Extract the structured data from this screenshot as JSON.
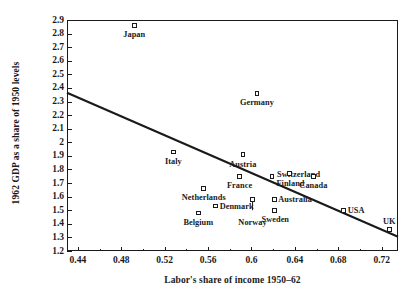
{
  "chart_data": {
    "type": "scatter",
    "title": "",
    "xlabel": "Labor's share of income 1950–62",
    "ylabel": "1962 GDP as a share of 1950 levels",
    "xlim": [
      0.43,
      0.735
    ],
    "ylim": [
      1.2,
      2.9
    ],
    "grid": false,
    "legend": "none",
    "xticks": [
      "0.44",
      "0.48",
      "0.52",
      "0.56",
      "0.6",
      "0.64",
      "0.68",
      "0.72"
    ],
    "xtick_values": [
      0.44,
      0.48,
      0.52,
      0.56,
      0.6,
      0.64,
      0.68,
      0.72
    ],
    "xminor_values": [
      0.46,
      0.5,
      0.54,
      0.58,
      0.62,
      0.66,
      0.7
    ],
    "yticks": [
      "2.9",
      "2.8",
      "2.7",
      "2.6",
      "2.5",
      "2.4",
      "2.3",
      "2.2",
      "2.1",
      "2",
      "1.9",
      "1.8",
      "1.7",
      "1.6",
      "1.5",
      "1.4",
      "1.3",
      "1.2"
    ],
    "ytick_values": [
      2.9,
      2.8,
      2.7,
      2.6,
      2.5,
      2.4,
      2.3,
      2.2,
      2.1,
      2.0,
      1.9,
      1.8,
      1.7,
      1.6,
      1.5,
      1.4,
      1.3,
      1.2
    ],
    "points": [
      {
        "label": "Japan",
        "x": 0.492,
        "y": 2.86,
        "label_pos": "center",
        "label_dx": 0,
        "label_dy": 6
      },
      {
        "label": "Germany",
        "x": 0.605,
        "y": 2.36,
        "label_pos": "center",
        "label_dx": 0,
        "label_dy": 6
      },
      {
        "label": "Italy",
        "x": 0.528,
        "y": 1.93,
        "label_pos": "center",
        "label_dx": 0,
        "label_dy": 6
      },
      {
        "label": "Austria",
        "x": 0.592,
        "y": 1.91,
        "label_pos": "center",
        "label_dx": 0,
        "label_dy": 6
      },
      {
        "label": "Switzerland",
        "x": 0.619,
        "y": 1.75,
        "label_pos": "left",
        "label_dx": 5,
        "label_dy": -5
      },
      {
        "label": "France",
        "x": 0.589,
        "y": 1.75,
        "label_pos": "center",
        "label_dx": 0,
        "label_dy": 6
      },
      {
        "label": "Finland",
        "x": 0.635,
        "y": 1.77,
        "label_pos": "center",
        "label_dx": 1,
        "label_dy": 6
      },
      {
        "label": "Canada",
        "x": 0.657,
        "y": 1.75,
        "label_pos": "center",
        "label_dx": 0,
        "label_dy": 6
      },
      {
        "label": "Netherlands",
        "x": 0.556,
        "y": 1.66,
        "label_pos": "center",
        "label_dx": 0,
        "label_dy": 6
      },
      {
        "label": "Denmark",
        "x": 0.567,
        "y": 1.53,
        "label_pos": "left",
        "label_dx": 4,
        "label_dy": -3.5
      },
      {
        "label": "Belgium",
        "x": 0.551,
        "y": 1.48,
        "label_pos": "center",
        "label_dx": 0,
        "label_dy": 6
      },
      {
        "label": "Norway",
        "x": 0.601,
        "y": 1.58,
        "label_pos": "center",
        "label_dx": 0,
        "label_dy": 20
      },
      {
        "label": "Australia",
        "x": 0.621,
        "y": 1.58,
        "label_pos": "left",
        "label_dx": 4,
        "label_dy": -3.5
      },
      {
        "label": "Sweden",
        "x": 0.621,
        "y": 1.5,
        "label_pos": "center",
        "label_dx": 1,
        "label_dy": 6
      },
      {
        "label": "USA",
        "x": 0.685,
        "y": 1.5,
        "label_pos": "left",
        "label_dx": 4,
        "label_dy": -3.5
      },
      {
        "label": "UK",
        "x": 0.727,
        "y": 1.36,
        "label_pos": "center",
        "label_dx": 0,
        "label_dy": -11
      }
    ],
    "leader_lines": [
      {
        "label": "Norway",
        "x": 0.601,
        "y_from": 1.58,
        "y_to": 1.5
      }
    ],
    "trendline": {
      "x_start": 0.43,
      "y_start": 2.365,
      "x_end": 0.735,
      "y_end": 1.305,
      "color": "#1a1a1a"
    }
  }
}
